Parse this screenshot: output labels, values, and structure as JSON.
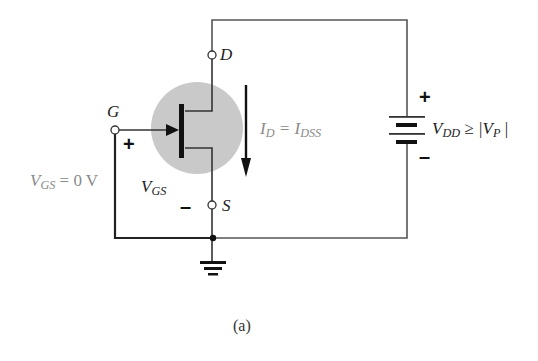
{
  "figure": {
    "caption": "(a)"
  },
  "terminals": {
    "drain": "D",
    "gate": "G",
    "source": "S"
  },
  "labels": {
    "vgs_condition": {
      "main": "V",
      "sub": "GS",
      "rest": " = 0 V"
    },
    "vgs": {
      "main": "V",
      "sub": "GS"
    },
    "id_eq": {
      "main": "I",
      "sub": "D",
      "mid": " = I",
      "sub2": "DSS"
    },
    "vdd": {
      "main": "V",
      "sub": "DD",
      "rest": " ≥ |V",
      "sub2": "P",
      "end": " |"
    }
  },
  "polarity": {
    "gate_plus": "+",
    "source_minus": "–",
    "battery_plus": "+",
    "battery_minus": "–"
  },
  "colors": {
    "wire": "#555555",
    "channel_highlight": "#c8c8c8",
    "label_gray": "#8a8a8a",
    "ink": "#111111"
  }
}
